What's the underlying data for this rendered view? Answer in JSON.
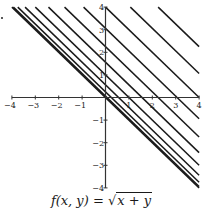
{
  "chart_data": {
    "type": "line",
    "subtype": "contour",
    "xlabel": "",
    "ylabel": "",
    "xlim": [
      -4,
      4
    ],
    "ylim": [
      -4,
      4
    ],
    "xticks": [
      -4,
      -3,
      -2,
      -1,
      1,
      2,
      3,
      4
    ],
    "yticks": [
      -4,
      -3,
      -2,
      -1,
      1,
      2,
      3,
      4
    ],
    "grid": false,
    "legend": null,
    "levels_f": [
      0,
      0.25,
      0.5,
      0.75,
      1,
      1.25,
      1.5,
      1.75,
      2,
      2.25,
      2.5
    ],
    "levels_c": [
      0,
      0.0625,
      0.25,
      0.5625,
      1,
      1.5625,
      2.25,
      3.0625,
      4,
      5.0625,
      6.25
    ],
    "line_color": "#1a1a1a",
    "axis_color": "#333333"
  },
  "caption": {
    "text_prefix": "f(x, y) = ",
    "radicand": "x + y"
  }
}
